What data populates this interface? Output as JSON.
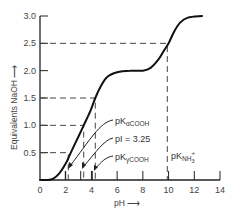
{
  "chart_data": {
    "type": "line",
    "title": "",
    "xlabel": "pH",
    "ylabel": "Equivalents NaOH",
    "xlim": [
      0,
      14
    ],
    "ylim": [
      0,
      3.0
    ],
    "grid": false,
    "legend": null,
    "x_ticks": [
      0,
      2,
      4,
      6,
      8,
      10,
      12,
      14
    ],
    "x_tick_labels": [
      "0",
      "2",
      "4",
      "6",
      "8",
      "10",
      "12",
      "14"
    ],
    "y_ticks": [
      0.5,
      1.0,
      1.5,
      2.0,
      2.5,
      3.0
    ],
    "y_tick_labels": [
      "0.5",
      "1.0",
      "1.5",
      "2.0",
      "2.5",
      "3.0"
    ],
    "series": [
      {
        "name": "Titration curve",
        "x": [
          0,
          0.5,
          1.0,
          1.5,
          2.0,
          2.3,
          2.5,
          3.0,
          3.4,
          3.9,
          4.3,
          4.7,
          5.2,
          6.0,
          7.0,
          8.0,
          8.6,
          9.2,
          9.6,
          10.0,
          10.4,
          10.9,
          11.5,
          12.6
        ],
        "y": [
          0,
          0.0,
          0.02,
          0.12,
          0.3,
          0.45,
          0.55,
          0.8,
          1.0,
          1.25,
          1.5,
          1.7,
          1.88,
          1.97,
          2.0,
          2.0,
          2.05,
          2.2,
          2.35,
          2.5,
          2.7,
          2.88,
          2.97,
          3.0
        ]
      }
    ],
    "reference_lines": [
      {
        "eq": 0.5,
        "pH": 2.2,
        "label": "pKαCOOH"
      },
      {
        "eq": 1.0,
        "pH": 3.4,
        "label": "pI = 3.25"
      },
      {
        "eq": 1.5,
        "pH": 4.3,
        "label": "pKγCOOH"
      },
      {
        "eq": 2.5,
        "pH": 9.9,
        "label": "pKNH3+"
      }
    ],
    "annotations": [
      {
        "text": "pK",
        "sub": "αCOOH"
      },
      {
        "text": "pI = 3.25"
      },
      {
        "text": "pK",
        "sub": "γCOOH"
      },
      {
        "text": "pK",
        "sub": "NH",
        "sub2": "3",
        "sup": "+"
      }
    ]
  },
  "labels": {
    "ylabel": "Equivalents NaOH",
    "xlabel": "pH",
    "pk_alpha_main": "pK",
    "pk_alpha_sub": "αCOOH",
    "pi": "pI = 3.25",
    "pk_gamma_main": "pK",
    "pk_gamma_sub": "γCOOH",
    "pk_nh3_main": "pK",
    "pk_nh3_sub": "NH",
    "pk_nh3_sub2": "3",
    "pk_nh3_sup": "+"
  },
  "colors": {
    "curve": "#111111",
    "axis": "#222222",
    "dash": "#444444",
    "text": "#333333"
  }
}
